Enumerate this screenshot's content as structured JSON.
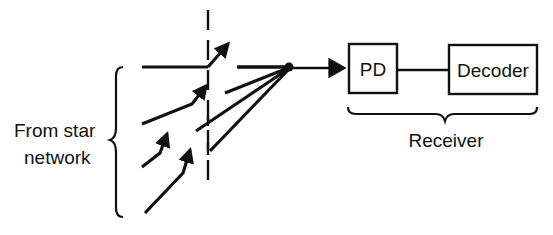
{
  "diagram": {
    "type": "optical-receiver-block-diagram",
    "colors": {
      "ink": "#111111",
      "background": "#ffffff"
    },
    "source": {
      "label_line1": "From star",
      "label_line2": "network"
    },
    "blocks": [
      {
        "id": "pd",
        "label": "PD"
      },
      {
        "id": "decoder",
        "label": "Decoder"
      }
    ],
    "receiver": {
      "label": "Receiver"
    },
    "connections": [
      {
        "from": "combiner",
        "to": "pd",
        "kind": "arrow"
      },
      {
        "from": "pd",
        "to": "decoder",
        "kind": "line"
      }
    ]
  }
}
